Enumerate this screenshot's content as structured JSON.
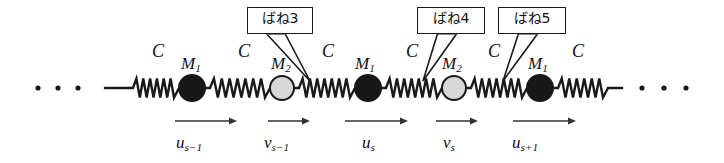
{
  "figure": {
    "background_color": "#ffffff",
    "ink_color": "#1a1a1a",
    "width": 724,
    "height": 163
  },
  "callouts": [
    {
      "id": "spring3",
      "text": "ばね3",
      "box": {
        "x": 247,
        "y": 7,
        "w": 66,
        "h": 27
      },
      "pointer_tip": {
        "x": 310,
        "y": 81
      }
    },
    {
      "id": "spring4",
      "text": "ばね4",
      "box": {
        "x": 417,
        "y": 7,
        "w": 68,
        "h": 27
      },
      "pointer_tip": {
        "x": 423,
        "y": 81
      }
    },
    {
      "id": "spring5",
      "text": "ばね5",
      "box": {
        "x": 498,
        "y": 7,
        "w": 68,
        "h": 27
      },
      "pointer_tip": {
        "x": 503,
        "y": 81
      }
    }
  ],
  "spring_labels": [
    {
      "text": "C",
      "x": 152,
      "y": 42
    },
    {
      "text": "C",
      "x": 238,
      "y": 42
    },
    {
      "text": "C",
      "x": 322,
      "y": 42
    },
    {
      "text": "C",
      "x": 406,
      "y": 42
    },
    {
      "text": "C",
      "x": 488,
      "y": 42
    },
    {
      "text": "C",
      "x": 572,
      "y": 42
    }
  ],
  "mass_labels": [
    {
      "symbol": "M",
      "sub": "1",
      "x": 181,
      "y": 55
    },
    {
      "symbol": "M",
      "sub": "2",
      "x": 271,
      "y": 55
    },
    {
      "symbol": "M",
      "sub": "1",
      "x": 355,
      "y": 55
    },
    {
      "symbol": "M",
      "sub": "2",
      "x": 442,
      "y": 55
    },
    {
      "symbol": "M",
      "sub": "1",
      "x": 528,
      "y": 55
    }
  ],
  "masses": [
    {
      "kind": "M1",
      "cx": 192,
      "cy": 88,
      "r": 13,
      "fill": "#181818",
      "stroke": "#181818"
    },
    {
      "kind": "M2",
      "cx": 282,
      "cy": 88,
      "r": 12,
      "fill": "#d8d8d8",
      "stroke": "#1a1a1a"
    },
    {
      "kind": "M1",
      "cx": 368,
      "cy": 88,
      "r": 13,
      "fill": "#181818",
      "stroke": "#181818"
    },
    {
      "kind": "M2",
      "cx": 454,
      "cy": 88,
      "r": 12,
      "fill": "#d8d8d8",
      "stroke": "#1a1a1a"
    },
    {
      "kind": "M1",
      "cx": 540,
      "cy": 88,
      "r": 13,
      "fill": "#181818",
      "stroke": "#181818"
    }
  ],
  "springs": [
    {
      "x1": 128,
      "x2": 179,
      "coils": 6
    },
    {
      "x1": 205,
      "x2": 270,
      "coils": 7
    },
    {
      "x1": 294,
      "x2": 355,
      "coils": 7
    },
    {
      "x1": 381,
      "x2": 442,
      "coils": 7
    },
    {
      "x1": 466,
      "x2": 527,
      "coils": 7
    },
    {
      "x1": 553,
      "x2": 608,
      "coils": 6
    }
  ],
  "lead_lines": [
    {
      "x1": 105,
      "x2": 128,
      "y": 88
    },
    {
      "x1": 608,
      "x2": 622,
      "y": 88
    }
  ],
  "ellipsis_left": {
    "cy": 88,
    "r": 2.6,
    "points": [
      38,
      58,
      78
    ]
  },
  "ellipsis_right": {
    "cy": 88,
    "r": 2.6,
    "points": [
      642,
      664,
      686
    ]
  },
  "displacement_arrows": [
    {
      "id": "u-s-minus-1",
      "x1": 175,
      "x2": 237,
      "y": 121
    },
    {
      "id": "v-s-minus-1",
      "x1": 268,
      "x2": 310,
      "y": 121
    },
    {
      "id": "u-s",
      "x1": 345,
      "x2": 408,
      "y": 121
    },
    {
      "id": "v-s",
      "x1": 436,
      "x2": 478,
      "y": 121
    },
    {
      "id": "u-s-plus-1",
      "x1": 513,
      "x2": 576,
      "y": 121
    }
  ],
  "displacement_labels": [
    {
      "symbol": "u",
      "sub": "s−1",
      "x": 176,
      "y": 134
    },
    {
      "symbol": "v",
      "sub": "s−1",
      "x": 264,
      "y": 134
    },
    {
      "symbol": "u",
      "sub": "s",
      "x": 362,
      "y": 134
    },
    {
      "symbol": "v",
      "sub": "s",
      "x": 443,
      "y": 134
    },
    {
      "symbol": "u",
      "sub": "s+1",
      "x": 512,
      "y": 134
    }
  ]
}
